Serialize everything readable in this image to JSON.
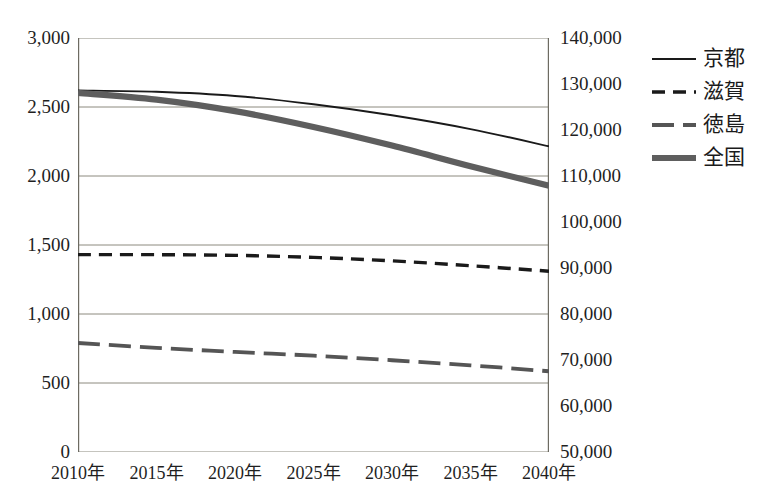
{
  "chart": {
    "title": "",
    "axes": {
      "x": {
        "label": "",
        "ticks": [
          "2010年",
          "2015年",
          "2020年",
          "2025年",
          "2030年",
          "2035年",
          "2040年"
        ]
      },
      "y_left": {
        "label": "",
        "ticks": [
          "0",
          "500",
          "1,000",
          "1,500",
          "2,000",
          "2,500",
          "3,000"
        ],
        "min": 0,
        "max": 3000
      },
      "y_right": {
        "label": "",
        "ticks": [
          "50,000",
          "60,000",
          "70,000",
          "80,000",
          "90,000",
          "100,000",
          "110,000",
          "120,000",
          "130,000",
          "140,000"
        ],
        "min": 50000,
        "max": 140000
      }
    },
    "legend": [
      {
        "label": "京都",
        "style": "solid-thin",
        "color": "#1a1a1a"
      },
      {
        "label": "滋賀",
        "style": "dashed",
        "color": "#1a1a1a"
      },
      {
        "label": "徳島",
        "style": "long-dash",
        "color": "#555555"
      },
      {
        "label": "全国",
        "style": "solid-thick",
        "color": "#5e5e5e"
      }
    ]
  },
  "chart_data": {
    "type": "line",
    "title": "",
    "xlabel": "",
    "ylabel": "",
    "x": [
      "2010年",
      "2015年",
      "2020年",
      "2025年",
      "2030年",
      "2035年",
      "2040年"
    ],
    "grid": true,
    "legend_position": "right",
    "axes": {
      "left": {
        "min": 0,
        "max": 3000,
        "tick_step": 500,
        "ticks": [
          0,
          500,
          1000,
          1500,
          2000,
          2500,
          3000
        ]
      },
      "right": {
        "min": 50000,
        "max": 140000,
        "tick_step": 10000,
        "ticks": [
          50000,
          60000,
          70000,
          80000,
          90000,
          100000,
          110000,
          120000,
          130000,
          140000
        ]
      }
    },
    "series": [
      {
        "name": "京都",
        "axis": "left",
        "style": "solid-thin",
        "color": "#1a1a1a",
        "values": [
          2620,
          2610,
          2580,
          2520,
          2440,
          2340,
          2215
        ]
      },
      {
        "name": "滋賀",
        "axis": "left",
        "style": "dashed",
        "color": "#1a1a1a",
        "values": [
          1430,
          1430,
          1425,
          1410,
          1385,
          1350,
          1310
        ]
      },
      {
        "name": "徳島",
        "axis": "left",
        "style": "long-dash",
        "color": "#555555",
        "values": [
          790,
          755,
          725,
          698,
          665,
          628,
          585
        ]
      },
      {
        "name": "全国",
        "axis": "right",
        "style": "solid-thick",
        "color": "#5e5e5e",
        "values": [
          128060,
          126600,
          124100,
          120660,
          116620,
          112120,
          107900
        ]
      }
    ]
  }
}
